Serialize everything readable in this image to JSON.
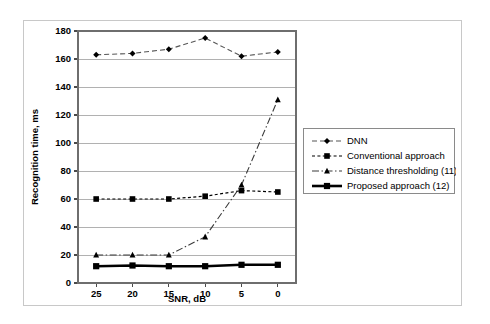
{
  "chart_data": {
    "type": "line",
    "title": "",
    "xlabel": "SNR, dB",
    "ylabel": "Recognition time, ms",
    "categories": [
      "25",
      "20",
      "15",
      "10",
      "5",
      "0"
    ],
    "ylim": [
      0,
      180
    ],
    "ytick_step": 20,
    "yticks": [
      "0",
      "20",
      "40",
      "60",
      "80",
      "100",
      "120",
      "140",
      "160",
      "180"
    ],
    "grid": "horizontal",
    "legend_position": "right",
    "series": [
      {
        "name": "DNN",
        "marker": "diamond",
        "linestyle": "dashed",
        "color": "#555555",
        "values": [
          163,
          164,
          167,
          175,
          162,
          165
        ]
      },
      {
        "name": "Conventional approach",
        "marker": "square",
        "linestyle": "dashed",
        "color": "#000000",
        "values": [
          60,
          60,
          60,
          62,
          66,
          65
        ]
      },
      {
        "name": "Distance thresholding (11)",
        "marker": "triangle",
        "linestyle": "dash-dot",
        "color": "#3a3a3a",
        "values": [
          20,
          20,
          20,
          33,
          70,
          131
        ]
      },
      {
        "name": "Proposed approach (12)",
        "marker": "square",
        "linestyle": "solid-thick",
        "color": "#000000",
        "values": [
          12,
          12.5,
          12,
          12,
          13,
          13
        ]
      }
    ]
  },
  "axes": {
    "y_title": "Recognition time, ms",
    "x_title": "SNR, dB",
    "y_ticks": [
      "180",
      "160",
      "140",
      "120",
      "100",
      "80",
      "60",
      "40",
      "20",
      "0"
    ],
    "x_ticks": [
      "25",
      "20",
      "15",
      "10",
      "5",
      "0"
    ]
  },
  "legend": {
    "entries": [
      {
        "label": "DNN",
        "marker": "diamond-marker"
      },
      {
        "label": "Conventional approach",
        "marker": "square-marker"
      },
      {
        "label": "Distance thresholding (11)",
        "marker": "triangle-marker"
      },
      {
        "label": "Proposed approach (12)",
        "marker": "square-solid-marker"
      }
    ]
  }
}
